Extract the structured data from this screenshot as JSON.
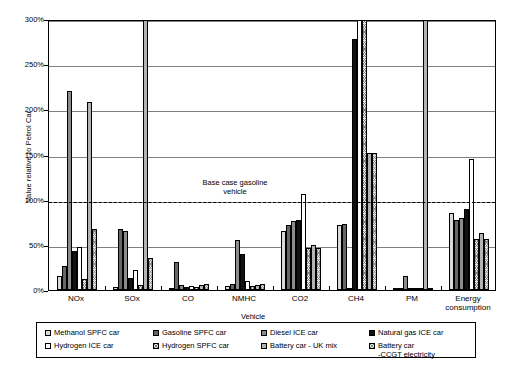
{
  "chart_data": {
    "type": "bar",
    "title": "",
    "xlabel": "Vehicle",
    "ylabel": "Value relative to Petrol Car",
    "ylim": [
      0,
      300
    ],
    "ytick_labels": [
      "0%",
      "50%",
      "100%",
      "150%",
      "200%",
      "250%",
      "300%"
    ],
    "ytick_values": [
      0,
      50,
      100,
      150,
      200,
      250,
      300
    ],
    "grid": true,
    "legend_position": "below",
    "categories": [
      "NOx",
      "SOx",
      "CO",
      "NMHC",
      "CO2",
      "CH4",
      "PM",
      "Energy\nconsumption"
    ],
    "annotation": "Base case gasoline\nvehicle",
    "annotation_value": 100,
    "series": [
      {
        "name": "Methanol SPFC car",
        "pattern": "light-grey",
        "values": [
          16,
          3,
          2,
          4,
          65,
          72,
          1,
          85
        ]
      },
      {
        "name": "Gasoline SPFC car",
        "pattern": "dark-grey",
        "values": [
          27,
          68,
          31,
          7,
          72,
          73,
          2,
          77
        ]
      },
      {
        "name": "Diesel ICE car",
        "pattern": "medium-grey",
        "values": [
          220,
          65,
          5,
          55,
          76,
          0,
          15,
          80
        ]
      },
      {
        "name": "Natural gas ICE car",
        "pattern": "black",
        "values": [
          43,
          13,
          3,
          40,
          78,
          278,
          1,
          90
        ]
      },
      {
        "name": "Hydrogen ICE car",
        "pattern": "white",
        "values": [
          48,
          22,
          4,
          10,
          106,
          305,
          1,
          145
        ]
      },
      {
        "name": "Hydrogen SPFC car",
        "pattern": "cross-hatch",
        "values": [
          12,
          6,
          3,
          4,
          47,
          305,
          1,
          57
        ]
      },
      {
        "name": "Battery car - UK mix",
        "pattern": "mid-grey",
        "values": [
          208,
          305,
          5,
          6,
          50,
          152,
          305,
          63
        ]
      },
      {
        "name": "Battery car\n-CCGT electricity",
        "pattern": "checker",
        "values": [
          68,
          35,
          7,
          7,
          47,
          152,
          2,
          57
        ]
      }
    ]
  },
  "legend": {
    "items": [
      {
        "label": "Methanol SPFC car"
      },
      {
        "label": "Gasoline SPFC car"
      },
      {
        "label": "Diesel ICE car"
      },
      {
        "label": "Natural gas ICE car"
      },
      {
        "label": "Hydrogen ICE car"
      },
      {
        "label": "Hydrogen SPFC car"
      },
      {
        "label": "Battery car - UK mix"
      },
      {
        "label": "Battery car\n-CCGT electricity"
      }
    ]
  }
}
